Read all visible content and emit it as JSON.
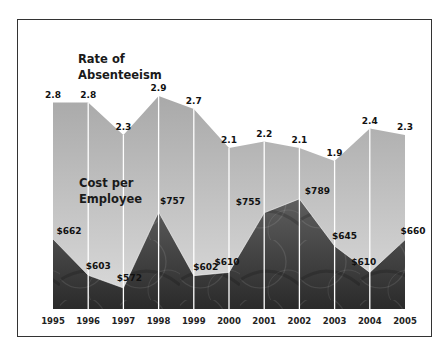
{
  "chart_data": {
    "type": "area",
    "title": "",
    "categories": [
      "1995",
      "1996",
      "1997",
      "1998",
      "1999",
      "2000",
      "2001",
      "2002",
      "2003",
      "2004",
      "2005"
    ],
    "series": [
      {
        "name": "Rate of Absenteeism",
        "label_lines": [
          "Rate of",
          "Absenteeism"
        ],
        "values": [
          2.8,
          2.8,
          2.3,
          2.9,
          2.7,
          2.1,
          2.2,
          2.1,
          1.9,
          2.4,
          2.3
        ],
        "labels": [
          "2.8",
          "2.8",
          "2.3",
          "2.9",
          "2.7",
          "2.1",
          "2.2",
          "2.1",
          "1.9",
          "2.4",
          "2.3"
        ],
        "color_top": "#a9a9a9",
        "color_bottom": "#dcdcdc"
      },
      {
        "name": "Cost per Employee",
        "label_lines": [
          "Cost per",
          "Employee"
        ],
        "values": [
          662,
          603,
          572,
          757,
          602,
          610,
          755,
          789,
          645,
          610,
          660
        ],
        "labels": [
          "$662",
          "$603",
          "$572",
          "$757",
          "$602",
          "$610",
          "$755",
          "$789",
          "$645",
          "$610",
          "$660"
        ],
        "color_top": "#5e5e5e",
        "color_bottom": "#2a2a2a"
      }
    ],
    "xlabel": "",
    "ylabel": "",
    "grid": false,
    "legend": "inline-left"
  }
}
